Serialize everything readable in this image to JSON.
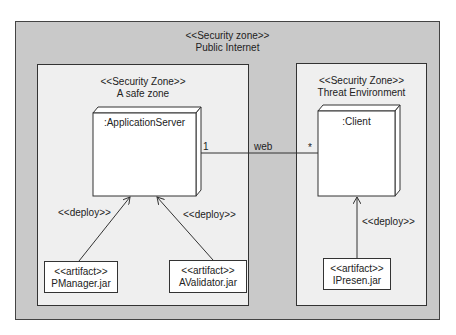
{
  "outer_zone": {
    "stereotype": "<<Security zone>>",
    "name": "Public Internet"
  },
  "zones": [
    {
      "stereotype": "<<Security Zone>>",
      "name": "A safe zone"
    },
    {
      "stereotype": "<<Security Zone>>",
      "name": "Threat Environment"
    }
  ],
  "nodes": [
    {
      "name": ":ApplicationServer"
    },
    {
      "name": ":Client"
    }
  ],
  "association": {
    "label": "web",
    "left_multiplicity": "1",
    "right_multiplicity": "*"
  },
  "artifacts": [
    {
      "stereotype": "<<artifact>>",
      "name": "PManager.jar",
      "relation": "<<deploy>>"
    },
    {
      "stereotype": "<<artifact>>",
      "name": "AValidator.jar",
      "relation": "<<deploy>>"
    },
    {
      "stereotype": "<<artifact>>",
      "name": "IPresen.jar",
      "relation": "<<deploy>>"
    }
  ],
  "colors": {
    "outer_bg": "#c9c9c9",
    "zone_bg": "#efefef",
    "node_bg": "#ffffff",
    "line": "#333333"
  }
}
